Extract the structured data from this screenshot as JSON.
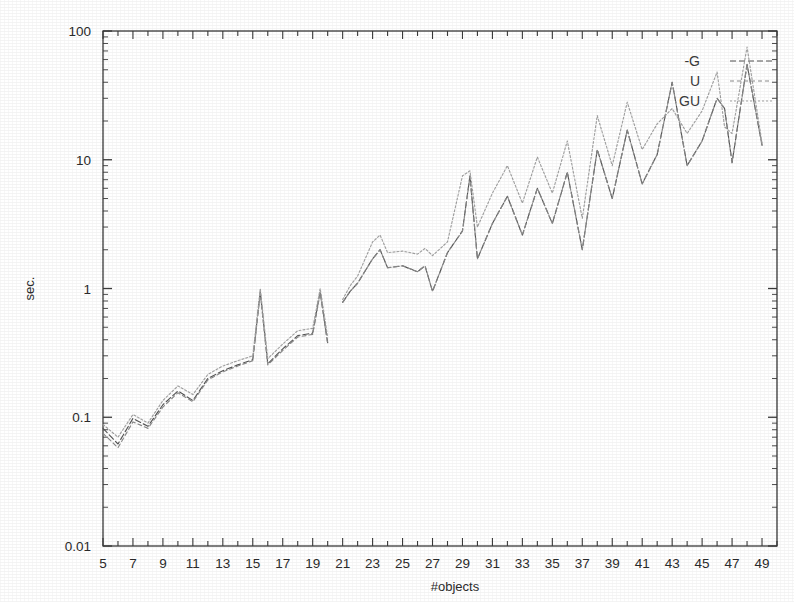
{
  "chart_data": {
    "type": "line",
    "title": "",
    "xlabel": "#objects",
    "ylabel": "sec.",
    "yscale": "log",
    "ylim": [
      0.01,
      100
    ],
    "xlim": [
      5,
      50
    ],
    "grid": false,
    "legend_position": "top-right",
    "y_tick_labels": [
      "100",
      "10",
      "1",
      "0.1",
      "0.01"
    ],
    "y_tick_values": [
      100,
      10,
      1,
      0.1,
      0.01
    ],
    "x_tick_labels": [
      "5",
      "7",
      "9",
      "11",
      "13",
      "15",
      "17",
      "19",
      "21",
      "23",
      "25",
      "27",
      "29",
      "31",
      "33",
      "35",
      "37",
      "39",
      "41",
      "43",
      "45",
      "47",
      "49"
    ],
    "x_tick_values": [
      5,
      7,
      9,
      11,
      13,
      15,
      17,
      19,
      21,
      23,
      25,
      27,
      29,
      31,
      33,
      35,
      37,
      39,
      41,
      43,
      45,
      47,
      49
    ],
    "x": [
      5,
      6,
      7,
      8,
      9,
      10,
      11,
      12,
      13,
      14,
      15,
      15.5,
      16,
      17,
      18,
      19,
      19.5,
      20,
      21,
      21.5,
      22,
      23,
      23.5,
      24,
      25,
      26,
      26.5,
      27,
      28,
      29,
      29.5,
      30,
      31,
      32,
      33,
      34,
      35,
      36,
      37,
      38,
      39,
      40,
      41,
      42,
      43,
      44,
      45,
      46,
      46.5,
      47,
      48,
      49
    ],
    "series": [
      {
        "name": "-G",
        "dash": "6,3",
        "color": "#555555",
        "values": [
          0.082,
          0.062,
          0.098,
          0.085,
          0.125,
          0.16,
          0.135,
          0.2,
          0.23,
          0.255,
          0.28,
          0.95,
          0.26,
          0.34,
          0.43,
          0.45,
          0.95,
          0.38,
          0.78,
          0.95,
          1.1,
          1.7,
          2.0,
          1.45,
          1.5,
          1.35,
          1.5,
          0.95,
          1.9,
          2.8,
          7.5,
          1.7,
          3.2,
          5.2,
          2.6,
          6.0,
          3.2,
          8.0,
          2.0,
          12.0,
          5.0,
          17.0,
          6.5,
          11.0,
          40.0,
          9.0,
          14.0,
          30.0,
          25.0,
          9.5,
          55.0,
          13.0
        ]
      },
      {
        "name": "U",
        "dash": "4,3",
        "color": "#8a8a8a",
        "values": [
          0.075,
          0.058,
          0.092,
          0.082,
          0.12,
          0.155,
          0.132,
          0.195,
          0.225,
          0.25,
          0.275,
          0.92,
          0.255,
          0.33,
          0.42,
          0.44,
          0.92,
          0.37,
          0.78,
          0.95,
          1.1,
          1.7,
          2.0,
          1.45,
          1.5,
          1.35,
          1.5,
          0.95,
          1.9,
          2.8,
          7.4,
          1.7,
          3.2,
          5.2,
          2.6,
          6.0,
          3.2,
          8.0,
          2.0,
          12.0,
          5.0,
          17.0,
          6.5,
          11.0,
          40.0,
          9.0,
          14.0,
          30.0,
          25.0,
          9.5,
          55.0,
          13.0
        ]
      },
      {
        "name": "GU",
        "dash": "2,2",
        "color": "#a2a2a2",
        "values": [
          0.088,
          0.07,
          0.105,
          0.09,
          0.135,
          0.175,
          0.15,
          0.215,
          0.25,
          0.275,
          0.3,
          1.0,
          0.285,
          0.37,
          0.47,
          0.49,
          1.0,
          0.42,
          0.82,
          1.05,
          1.25,
          2.3,
          2.6,
          1.9,
          1.95,
          1.85,
          2.05,
          1.8,
          2.3,
          7.5,
          8.2,
          3.0,
          5.5,
          9.0,
          4.6,
          10.5,
          5.5,
          14.0,
          3.5,
          22.0,
          9.0,
          28.0,
          12.0,
          19.0,
          25.0,
          16.0,
          24.0,
          48.0,
          18.0,
          16.0,
          75.0,
          13.5
        ]
      }
    ]
  },
  "legend": {
    "items": [
      {
        "label": "-G"
      },
      {
        "label": "U"
      },
      {
        "label": "GU"
      }
    ]
  },
  "axes": {
    "x_title": "#objects",
    "y_title": "sec."
  }
}
